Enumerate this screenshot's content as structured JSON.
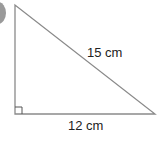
{
  "diagram": {
    "type": "right-triangle",
    "hypotenuse_label": "15 cm",
    "base_label": "12 cm",
    "right_angle_marker": true,
    "stroke_color": "#8a8a8a",
    "vertices": {
      "top": [
        15,
        5
      ],
      "bottom_left": [
        15,
        114
      ],
      "bottom_right": [
        155,
        114
      ]
    }
  }
}
